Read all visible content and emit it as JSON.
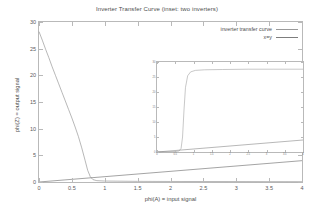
{
  "chart_data": {
    "type": "line",
    "title": "Inverter Transfer Curve (inset: two inverters)",
    "xlabel": "phi(A) = input signal",
    "ylabel": "phi(Z) = output signal",
    "xlim": [
      0,
      4
    ],
    "ylim": [
      0,
      30
    ],
    "xticks": [
      "0",
      "0.5",
      "1",
      "1.5",
      "2",
      "2.5",
      "3",
      "3.5",
      "4"
    ],
    "xtickvals": [
      0,
      0.5,
      1,
      1.5,
      2,
      2.5,
      3,
      3.5,
      4
    ],
    "yticks": [
      "0",
      "5",
      "10",
      "15",
      "20",
      "25",
      "30"
    ],
    "ytickvals": [
      0,
      5,
      10,
      15,
      20,
      25,
      30
    ],
    "grid": false,
    "legend_position": "top-right",
    "series": [
      {
        "name": "inverter transfer curve",
        "color": "#9a9a9a",
        "points": [
          [
            0.0,
            28.2
          ],
          [
            0.05,
            26.6
          ],
          [
            0.1,
            24.9
          ],
          [
            0.15,
            23.3
          ],
          [
            0.2,
            21.6
          ],
          [
            0.25,
            20.0
          ],
          [
            0.3,
            18.4
          ],
          [
            0.35,
            16.8
          ],
          [
            0.4,
            15.2
          ],
          [
            0.45,
            13.6
          ],
          [
            0.5,
            12.0
          ],
          [
            0.55,
            10.3
          ],
          [
            0.6,
            8.5
          ],
          [
            0.65,
            6.4
          ],
          [
            0.7,
            4.1
          ],
          [
            0.74,
            2.2
          ],
          [
            0.78,
            1.0
          ],
          [
            0.82,
            0.45
          ],
          [
            0.88,
            0.25
          ],
          [
            1.0,
            0.18
          ],
          [
            1.5,
            0.12
          ],
          [
            2.0,
            0.1
          ],
          [
            2.5,
            0.09
          ],
          [
            3.0,
            0.08
          ],
          [
            3.5,
            0.07
          ],
          [
            4.0,
            0.06
          ]
        ]
      },
      {
        "name": "x=y",
        "color": "#7d7d7d",
        "points": [
          [
            0,
            0
          ],
          [
            4,
            4
          ]
        ]
      }
    ],
    "inset": {
      "type": "line",
      "xlim": [
        0,
        4
      ],
      "ylim": [
        0,
        30
      ],
      "xticks": [
        "0",
        "0.5",
        "1",
        "1.5",
        "2",
        "2.5",
        "3",
        "3.5",
        "4"
      ],
      "xtickvals": [
        0,
        0.5,
        1,
        1.5,
        2,
        2.5,
        3,
        3.5,
        4
      ],
      "yticks": [
        "0",
        "5",
        "10",
        "15",
        "20",
        "25",
        "30"
      ],
      "ytickvals": [
        0,
        5,
        10,
        15,
        20,
        25,
        30
      ],
      "series": [
        {
          "name": "two inverters",
          "color": "#9a9a9a",
          "points": [
            [
              0.0,
              0.1
            ],
            [
              0.3,
              0.12
            ],
            [
              0.5,
              0.16
            ],
            [
              0.6,
              0.3
            ],
            [
              0.66,
              1.2
            ],
            [
              0.7,
              5.0
            ],
            [
              0.74,
              14.0
            ],
            [
              0.78,
              21.5
            ],
            [
              0.84,
              25.4
            ],
            [
              0.92,
              26.7
            ],
            [
              1.05,
              27.2
            ],
            [
              1.3,
              27.4
            ],
            [
              1.8,
              27.5
            ],
            [
              2.5,
              27.6
            ],
            [
              3.2,
              27.6
            ],
            [
              4.0,
              27.6
            ]
          ]
        },
        {
          "name": "x=y",
          "color": "#7d7d7d",
          "points": [
            [
              0,
              0
            ],
            [
              4,
              4
            ]
          ]
        }
      ]
    }
  },
  "legend": {
    "entries": [
      {
        "label": "inverter transfer curve",
        "color": "#9a9a9a"
      },
      {
        "label": "x=y",
        "color": "#7d7d7d"
      }
    ]
  }
}
